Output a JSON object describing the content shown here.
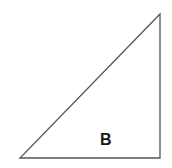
{
  "diagram": {
    "type": "right-triangle",
    "label": "B",
    "vertices": {
      "top": [
        160,
        14
      ],
      "bottom_left": [
        20,
        158
      ],
      "bottom_right": [
        160,
        158
      ]
    },
    "stroke_color": "#555555",
    "label_color": "#1a1a1a"
  }
}
